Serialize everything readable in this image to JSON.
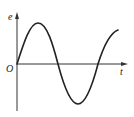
{
  "diagram": {
    "type": "sine-wave-graph",
    "axes": {
      "y_label": "e",
      "x_label": "t",
      "origin_label": "O"
    },
    "curve": {
      "description": "sinusoidal e vs t starting at origin, rising to peak, crossing zero, trough, rising again",
      "color": "#222222"
    },
    "colors": {
      "axis": "#333333",
      "background": "#ffffff"
    }
  }
}
